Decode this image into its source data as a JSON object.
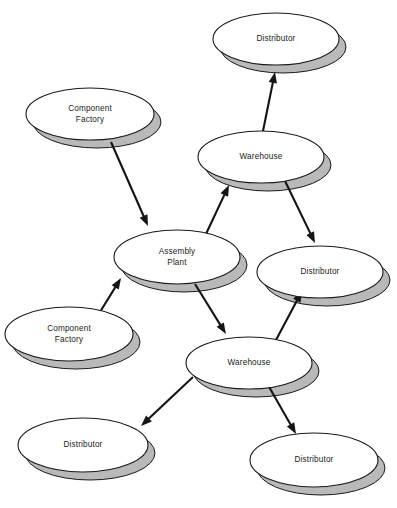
{
  "diagram": {
    "type": "node-link-diagram",
    "style": {
      "node_shape": "ellipse-3d-disc",
      "node_fill": "#ffffff",
      "node_stroke": "#1a1a1a",
      "node_shadow_fill": "#b9b9b9",
      "edge_color": "#141414",
      "background": "#ffffff"
    },
    "nodes": [
      {
        "id": "distributor-top",
        "label": "Distributor",
        "role": "Distributor",
        "cx": 276,
        "cy": 39,
        "rx": 63,
        "ry": 26
      },
      {
        "id": "component-factory-upper",
        "label": "Component\nFactory",
        "line1": "Component",
        "line2": "Factory",
        "role": "Component Factory",
        "cx": 90,
        "cy": 114,
        "rx": 64,
        "ry": 26
      },
      {
        "id": "warehouse-upper",
        "label": "Warehouse",
        "role": "Warehouse",
        "cx": 261,
        "cy": 157,
        "rx": 63,
        "ry": 26
      },
      {
        "id": "assembly-plant",
        "label": "Assembly\nPlant",
        "line1": "Assembly",
        "line2": "Plant",
        "role": "Assembly Plant",
        "cx": 177,
        "cy": 257,
        "rx": 63,
        "ry": 27
      },
      {
        "id": "distributor-right",
        "label": "Distributor",
        "role": "Distributor",
        "cx": 320,
        "cy": 272,
        "rx": 63,
        "ry": 26
      },
      {
        "id": "component-factory-lower",
        "label": "Component\nFactory",
        "line1": "Component",
        "line2": "Factory",
        "role": "Component Factory",
        "cx": 69,
        "cy": 334,
        "rx": 64,
        "ry": 27
      },
      {
        "id": "warehouse-lower",
        "label": "Warehouse",
        "role": "Warehouse",
        "cx": 249,
        "cy": 363,
        "rx": 63,
        "ry": 26
      },
      {
        "id": "distributor-bottom-left",
        "label": "Distributor",
        "role": "Distributor",
        "cx": 83,
        "cy": 445,
        "rx": 65,
        "ry": 27
      },
      {
        "id": "distributor-bottom-right",
        "label": "Distributor",
        "role": "Distributor",
        "cx": 314,
        "cy": 460,
        "rx": 64,
        "ry": 27
      }
    ],
    "edges": [
      {
        "id": "edge-cf-upper-to-assembly",
        "from": "component-factory-upper",
        "to": "assembly-plant",
        "x1": 111,
        "y1": 142,
        "x2": 148,
        "y2": 226
      },
      {
        "id": "edge-assembly-to-warehouse-upper",
        "from": "assembly-plant",
        "to": "warehouse-upper",
        "x1": 206,
        "y1": 234,
        "x2": 229,
        "y2": 185
      },
      {
        "id": "edge-warehouse-upper-to-distributor-top",
        "from": "warehouse-upper",
        "to": "distributor-top",
        "x1": 263,
        "y1": 131,
        "x2": 275,
        "y2": 72
      },
      {
        "id": "edge-warehouse-upper-to-distributor-right",
        "from": "warehouse-upper",
        "to": "distributor-right",
        "x1": 285,
        "y1": 181,
        "x2": 315,
        "y2": 243
      },
      {
        "id": "edge-cf-lower-to-assembly",
        "from": "component-factory-lower",
        "to": "assembly-plant",
        "x1": 100,
        "y1": 312,
        "x2": 121,
        "y2": 278
      },
      {
        "id": "edge-assembly-to-warehouse-lower",
        "from": "assembly-plant",
        "to": "warehouse-lower",
        "x1": 195,
        "y1": 284,
        "x2": 226,
        "y2": 334
      },
      {
        "id": "edge-warehouse-lower-to-distributor-right",
        "from": "warehouse-lower",
        "to": "distributor-right",
        "x1": 276,
        "y1": 340,
        "x2": 302,
        "y2": 291
      },
      {
        "id": "edge-warehouse-lower-to-distributor-bottom-left",
        "from": "warehouse-lower",
        "to": "distributor-bottom-left",
        "x1": 193,
        "y1": 377,
        "x2": 141,
        "y2": 426
      },
      {
        "id": "edge-warehouse-lower-to-distributor-bottom-right",
        "from": "warehouse-lower",
        "to": "distributor-bottom-right",
        "x1": 268,
        "y1": 385,
        "x2": 296,
        "y2": 434
      }
    ]
  }
}
